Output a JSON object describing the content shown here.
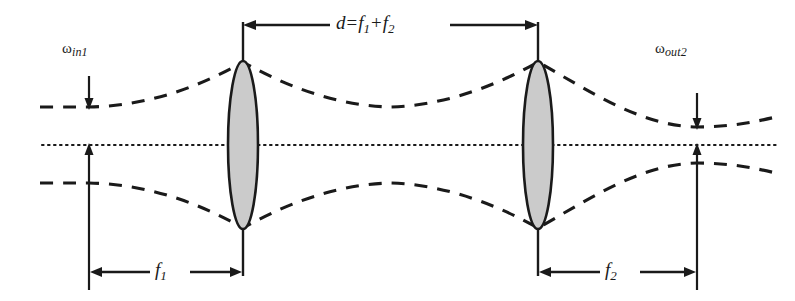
{
  "figure": {
    "background_color": "#ffffff",
    "ink_color": "#1a1a1a",
    "lens_fill_color": "#cccccc",
    "width": 795,
    "height": 301
  },
  "labels": {
    "omega_in": {
      "symbol": "ω",
      "subscript": "in1",
      "full": "ωin1"
    },
    "omega_out": {
      "symbol": "ω",
      "subscript": "out2",
      "full": "ωout2"
    },
    "separation": {
      "lhs": "d",
      "equals": "=",
      "term1": "f",
      "term1_sub": "1",
      "plus": "+",
      "term2": "f",
      "term2_sub": "2",
      "full": "d = f1 + f2"
    },
    "focal1": {
      "symbol": "f",
      "subscript": "1",
      "full": "f1"
    },
    "focal2": {
      "symbol": "f",
      "subscript": "2",
      "full": "f2"
    }
  },
  "elements": {
    "optical_axis": "dotted-horizontal-axis",
    "lens1": "converging-lens-1",
    "lens2": "converging-lens-2",
    "beam_envelope": "dashed-gaussian-beam-envelope",
    "dimension_d": "dimension-arrow-d",
    "dimension_f1": "dimension-arrow-f1",
    "dimension_f2": "dimension-arrow-f2",
    "waist_marker_in": "input-waist-arrow",
    "waist_marker_out": "output-waist-arrow"
  },
  "geometry": {
    "axis_y": 145,
    "lens1_x": 243,
    "lens2_x": 538,
    "waist_in_x": 89,
    "waist_mid_x": 390,
    "waist_out_x": 697,
    "lens_half_height": 89,
    "lens_half_width": 15
  }
}
